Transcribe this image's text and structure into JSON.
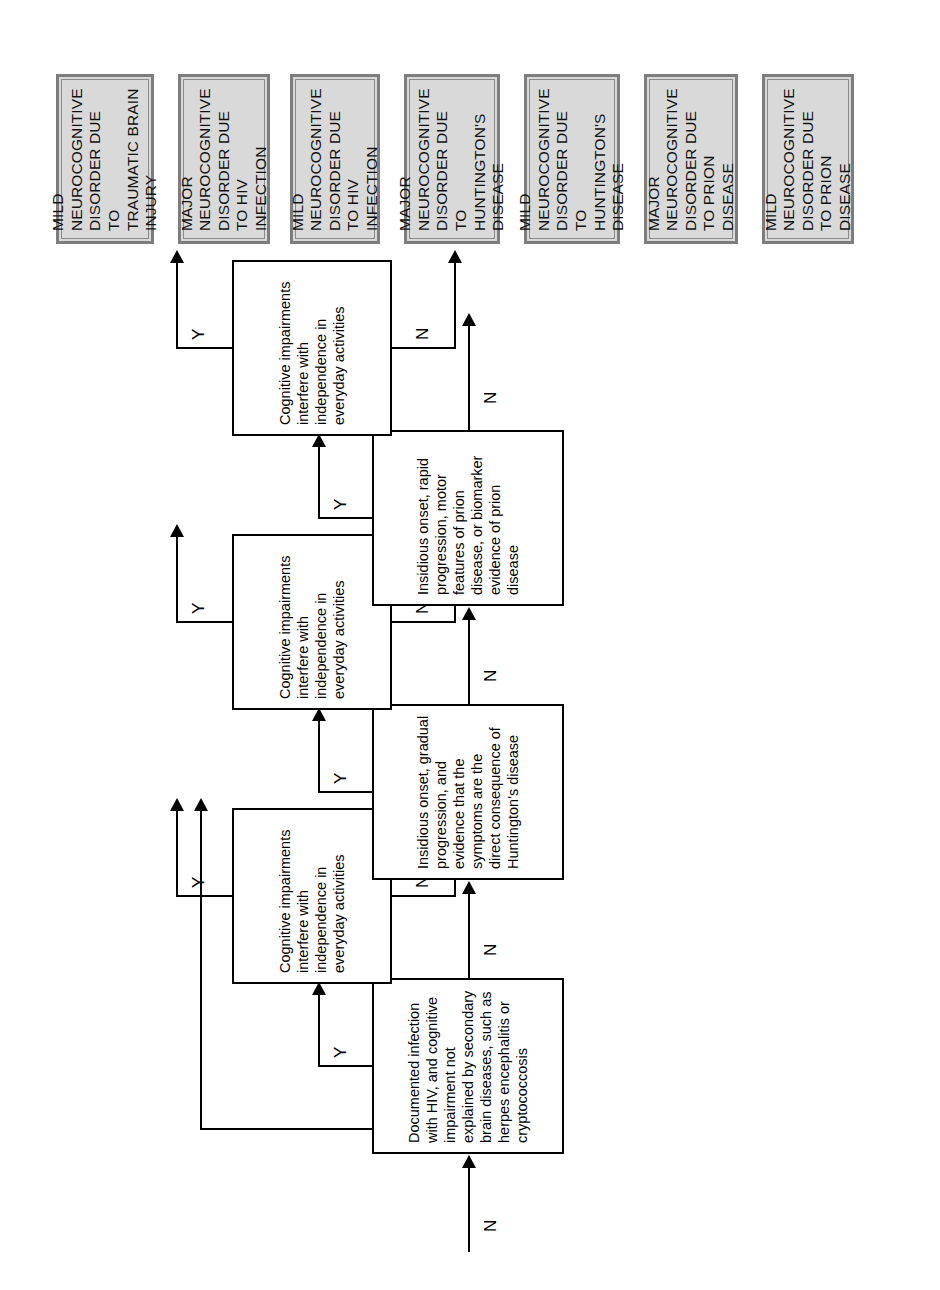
{
  "figure": {
    "type": "decision-tree-flowchart",
    "orientation": "landscape diagram rotated 90 degrees counter-clockwise on the page",
    "branch_labels": {
      "yes": "Y",
      "no": "N"
    }
  },
  "entry": {
    "label": "N",
    "description": "incoming no-branch arrow from the previous page of the algorithm"
  },
  "exit": {
    "label": "N",
    "description": "outgoing no-branch arrow continuing the algorithm"
  },
  "criteria": [
    {
      "id": "hiv",
      "text": "Documented infection with HIV, and cognitive impairment not explained by secondary brain diseases, such as herpes encephalitis or cryptococcosis",
      "yes_label": "Y",
      "no_label": "N"
    },
    {
      "id": "huntington",
      "text": "Insidious onset, gradual progression, and evidence that the symptoms are the direct consequence of Huntington's disease",
      "yes_label": "Y",
      "no_label": "N"
    },
    {
      "id": "prion",
      "text": "Insidious onset, rapid progression, motor features of prion disease, or biomarker evidence of prion disease",
      "yes_label": "Y",
      "no_label": "N"
    }
  ],
  "severity_gates": [
    {
      "id": "gate-hiv",
      "text": "Cognitive impairments interfere with independence in everyday activities",
      "yes_label": "Y",
      "no_label": "N"
    },
    {
      "id": "gate-huntington",
      "text": "Cognitive impairments interfere with independence in everyday activities",
      "yes_label": "Y",
      "no_label": "N"
    },
    {
      "id": "gate-prion",
      "text": "Cognitive impairments interfere with independence in everyday activities",
      "yes_label": "Y",
      "no_label": "N"
    }
  ],
  "outcomes": [
    {
      "id": "mild-tbi",
      "text": "MILD NEUROCOGNITIVE\nDISORDER DUE TO\nTRAUMATIC BRAIN INJURY"
    },
    {
      "id": "major-hiv",
      "text": "MAJOR NEUROCOGNITIVE\nDISORDER DUE TO HIV\nINFECTION"
    },
    {
      "id": "mild-hiv",
      "text": "MILD NEUROCOGNITIVE\nDISORDER DUE TO HIV\nINFECTION"
    },
    {
      "id": "major-huntington",
      "text": "MAJOR NEUROCOGNITIVE\nDISORDER DUE TO\nHUNTINGTON'S DISEASE"
    },
    {
      "id": "mild-huntington",
      "text": "MILD NEUROCOGNITIVE\nDISORDER DUE TO\nHUNTINGTON'S DISEASE"
    },
    {
      "id": "major-prion",
      "text": "MAJOR NEUROCOGNITIVE\nDISORDER DUE TO PRION\nDISEASE"
    },
    {
      "id": "mild-prion",
      "text": "MILD NEUROCOGNITIVE\nDISORDER DUE TO PRION\nDISEASE"
    }
  ],
  "colors": {
    "outcome_fill": "#d9d9d9",
    "outcome_border": "#7d7d7d",
    "process_fill": "#ffffff",
    "line": "#000000",
    "page_background": "#ffffff"
  }
}
